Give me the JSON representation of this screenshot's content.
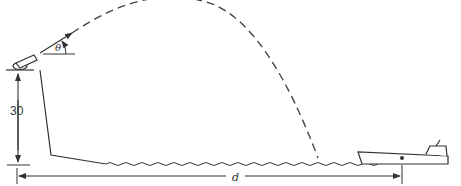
{
  "diagram": {
    "type": "projectile-motion-figure",
    "labels": {
      "height": "30",
      "angle": "θ",
      "distance": "d"
    },
    "elements": [
      "cannon on cliff",
      "launch angle",
      "dashed parabolic trajectory",
      "cliff profile",
      "wavy water surface",
      "boat",
      "height dimension arrow",
      "horizontal distance dimension arrow"
    ],
    "colors": {
      "line": "#333333",
      "background": "#ffffff"
    }
  }
}
